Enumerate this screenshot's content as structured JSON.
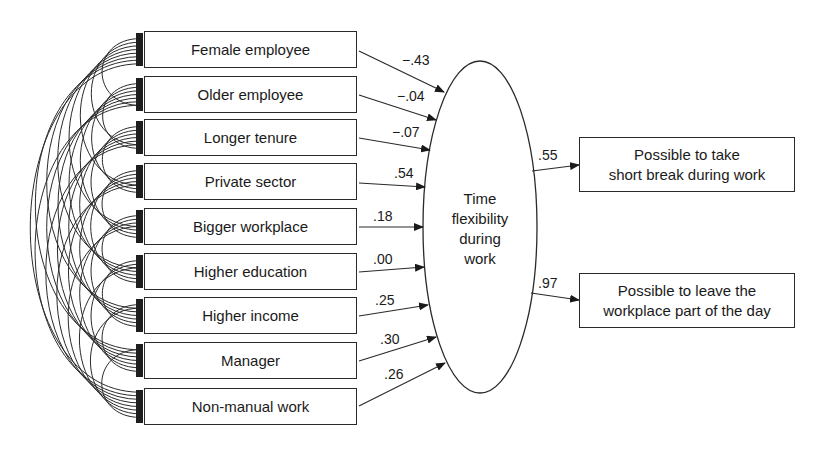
{
  "figure": {
    "type": "structural equation model path diagram",
    "latent": {
      "label_lines": [
        "Time",
        "flexibility",
        "during",
        "work"
      ]
    },
    "predictors": [
      {
        "label": "Female employee",
        "coef": "−.43"
      },
      {
        "label": "Older employee",
        "coef": "−.04"
      },
      {
        "label": "Longer tenure",
        "coef": "−.07"
      },
      {
        "label": "Private sector",
        "coef": ".54"
      },
      {
        "label": "Bigger workplace",
        "coef": ".18"
      },
      {
        "label": "Higher education",
        "coef": ".00"
      },
      {
        "label": "Higher income",
        "coef": ".25"
      },
      {
        "label": "Manager",
        "coef": ".30"
      },
      {
        "label": "Non-manual work",
        "coef": ".26"
      }
    ],
    "outcomes": [
      {
        "label_lines": [
          "Possible to take",
          "short break during work"
        ],
        "loading": ".55"
      },
      {
        "label_lines": [
          "Possible to leave the",
          "workplace part of the day"
        ],
        "loading": ".97"
      }
    ],
    "correlations": "all pairwise covariance arcs among the 9 predictors",
    "colors": {
      "line": "#2a2a2a",
      "text": "#1a1a1a",
      "background": "#ffffff"
    }
  }
}
